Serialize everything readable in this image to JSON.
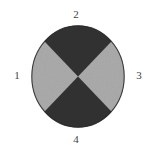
{
  "figure": {
    "kind": "quadrant-circle-diagram",
    "background_color": "#ffffff",
    "circle": {
      "fill_dark": "#2b2b2b",
      "fill_light": "#a8a8a8",
      "outline_color": "#1f1f1f",
      "center_x": 47,
      "center_y": 51.5,
      "radius_x": 46.5,
      "radius_y": 51,
      "wedges": [
        {
          "name": "top-wedge",
          "position": "top",
          "shade": "dark",
          "color": "#2b2b2b"
        },
        {
          "name": "right-wedge",
          "position": "right",
          "shade": "light",
          "color": "#a8a8a8"
        },
        {
          "name": "bottom-wedge",
          "position": "bottom",
          "shade": "dark",
          "color": "#2b2b2b"
        },
        {
          "name": "left-wedge",
          "position": "left",
          "shade": "light",
          "color": "#a8a8a8"
        }
      ]
    },
    "labels": {
      "top": "2",
      "left": "1",
      "right": "3",
      "bottom": "4"
    }
  }
}
